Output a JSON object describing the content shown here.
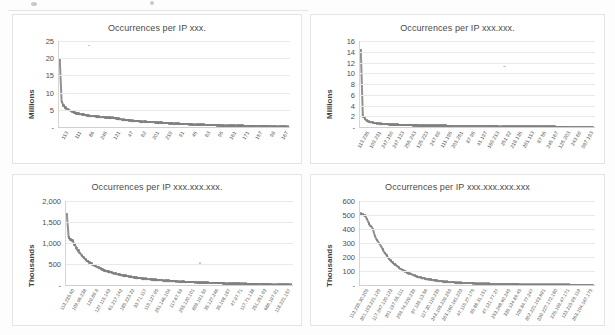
{
  "page": {
    "background_color": "#fdfdfd",
    "series_color": "#7f7f7f",
    "gridline_color": "#e9e9e9"
  },
  "charts": [
    {
      "id": "chart-ip-octet-1",
      "title": "Occurrences per IP xxx.",
      "ylabel": "Millions",
      "yticks": [
        "25",
        "20",
        "15",
        "10",
        "5",
        "-"
      ],
      "ytick_values": [
        25,
        20,
        15,
        10,
        5,
        0
      ],
      "ylim": [
        0,
        25
      ],
      "xlabels": [
        "113",
        "111",
        "86",
        "245",
        "121",
        "47",
        "62",
        "201",
        "219",
        "91",
        "45",
        "63",
        "95",
        "161",
        "171",
        "157",
        "98",
        "167"
      ],
      "values": [
        19.5,
        7.3,
        6.2,
        5.6,
        5.2,
        4.9,
        4.6,
        4.4,
        4.2,
        4.0,
        3.9,
        3.8,
        3.7,
        3.6,
        3.5,
        3.4,
        3.3,
        3.25,
        3.2,
        3.15,
        3.1,
        3.0,
        2.95,
        2.9,
        2.85,
        2.8,
        2.78,
        2.75,
        2.7,
        2.68,
        2.6,
        2.5,
        2.4,
        2.3,
        2.2,
        2.1,
        2.05,
        2.0,
        1.95,
        1.9,
        1.85,
        1.8,
        1.78,
        1.7,
        1.65,
        1.6,
        1.58,
        1.55,
        1.5,
        1.48,
        1.45,
        1.4,
        1.38,
        1.35,
        1.3,
        1.28,
        1.25,
        1.2,
        1.18,
        1.15,
        1.1,
        1.08,
        1.05,
        1.0,
        0.98,
        0.95,
        0.92,
        0.9,
        0.88,
        0.85,
        0.82,
        0.8,
        0.78,
        0.76,
        0.74,
        0.72,
        0.7,
        0.68,
        0.66,
        0.64,
        0.62,
        0.6,
        0.58,
        0.57,
        0.55,
        0.54,
        0.52,
        0.5,
        0.49,
        0.48,
        0.46,
        0.45,
        0.44,
        0.42,
        0.41,
        0.4,
        0.39,
        0.38,
        0.37,
        0.36,
        0.35,
        0.34,
        0.33,
        0.32,
        0.31,
        0.3,
        0.29,
        0.28,
        0.27,
        0.26,
        0.25,
        0.24,
        0.23,
        0.22,
        0.21,
        0.2,
        0.19,
        0.18,
        0.17,
        0.16,
        0.15,
        0.14,
        0.13,
        0.12,
        0.11,
        0.1
      ]
    },
    {
      "id": "chart-ip-octet-2",
      "title": "Occurrences per IP xxx.xxx.",
      "ylabel": "Millions",
      "yticks": [
        "16",
        "14",
        "12",
        "10",
        "8",
        "6",
        "4",
        "2",
        "-"
      ],
      "ytick_values": [
        16,
        14,
        12,
        10,
        8,
        6,
        4,
        2,
        0
      ],
      "ylim": [
        0,
        16
      ],
      "xlabels": [
        "113.235",
        "109.231",
        "247.150",
        "247.123",
        "255.243",
        "125.223",
        "247.69",
        "111.195",
        "201.251",
        "87.95",
        "41.197",
        "169.213",
        "251.92",
        "218.135",
        "281.113",
        "87.55",
        "245.167",
        "125.203",
        "243.69",
        "987.193"
      ],
      "values": [
        14.3,
        2.0,
        1.55,
        1.2,
        1.0,
        0.9,
        0.82,
        0.76,
        0.7,
        0.66,
        0.62,
        0.58,
        0.55,
        0.52,
        0.5,
        0.48,
        0.46,
        0.44,
        0.42,
        0.4,
        0.39,
        0.38,
        0.37,
        0.36,
        0.35,
        0.34,
        0.33,
        0.32,
        0.31,
        0.3,
        0.29,
        0.28,
        0.275,
        0.27,
        0.265,
        0.26,
        0.255,
        0.25,
        0.245,
        0.24,
        0.235,
        0.23,
        0.225,
        0.22,
        0.215,
        0.21,
        0.205,
        0.2,
        0.198,
        0.195,
        0.19,
        0.188,
        0.185,
        0.18,
        0.178,
        0.175,
        0.17,
        0.168,
        0.165,
        0.16,
        0.158,
        0.155,
        0.15,
        0.148,
        0.145,
        0.14,
        0.138,
        0.135,
        0.13,
        0.128,
        0.125,
        0.12,
        0.118,
        0.115,
        0.11,
        0.108,
        0.105,
        0.1,
        0.098,
        0.095,
        0.09,
        0.088,
        0.085,
        0.08,
        0.078,
        0.075,
        0.07,
        0.068,
        0.065,
        0.06,
        0.058,
        0.055,
        0.05,
        0.048,
        0.045,
        0.04,
        0.038,
        0.035,
        0.03,
        0.028,
        0.025,
        0.022,
        0.02,
        0.018,
        0.016,
        0.014,
        0.012,
        0.01,
        0.009,
        0.008,
        0.007,
        0.006,
        0.005,
        0.004,
        0.003,
        0.002
      ]
    },
    {
      "id": "chart-ip-octet-3",
      "title": "Occurrences per IP xxx.xxx.xxx.",
      "ylabel": "Thousands",
      "yticks": [
        "2,000",
        "1,500",
        "1,000",
        "500",
        "-"
      ],
      "ytick_values": [
        2000,
        1500,
        1000,
        500,
        0
      ],
      "ylim": [
        0,
        2000
      ],
      "xlabels": [
        "113.235.60",
        "109.96.238",
        "129.89.9",
        "127.115.143",
        "61.217.142",
        "185.223.22",
        "33.71.117",
        "115.127.95",
        "251.146.104",
        "117.67.59",
        "255.120.101",
        "809.191.50",
        "35.127.246",
        "35.108.187",
        "47.97.71",
        "117.71.138",
        "251.251.93",
        "686.197.91",
        "118.221.157"
      ],
      "values": [
        1690,
        1130,
        1080,
        1060,
        960,
        880,
        820,
        760,
        700,
        650,
        610,
        570,
        540,
        510,
        480,
        455,
        430,
        410,
        390,
        370,
        350,
        335,
        320,
        305,
        292,
        280,
        268,
        258,
        248,
        238,
        229,
        220,
        212,
        204,
        197,
        190,
        183,
        177,
        170,
        165,
        159,
        154,
        149,
        144,
        139,
        135,
        130,
        126,
        122,
        118,
        115,
        111,
        108,
        104,
        101,
        98,
        95,
        92,
        89,
        86,
        84,
        81,
        79,
        76,
        74,
        72,
        70,
        68,
        66,
        64,
        62,
        60,
        58,
        56,
        55,
        53,
        51,
        50,
        48,
        47,
        45,
        44,
        43,
        41,
        40,
        39,
        38,
        37,
        36,
        35,
        34,
        33,
        32,
        31,
        30,
        29,
        28,
        27,
        26,
        25,
        24,
        23,
        22,
        21,
        20,
        19,
        18,
        17,
        16,
        15,
        14,
        13,
        12,
        11,
        10,
        9,
        8,
        7,
        6,
        5
      ]
    },
    {
      "id": "chart-ip-octet-4",
      "title": "Occurrences per IP xxx.xxx.xxx.xxx",
      "ylabel": "Thousands",
      "yticks": [
        "600",
        "500",
        "400",
        "300",
        "200",
        "100",
        "-"
      ],
      "ytick_values": [
        600,
        500,
        400,
        300,
        200,
        100,
        0
      ],
      "ylim": [
        0,
        600
      ],
      "xlabels": [
        "113.235.30.205",
        "301.103.221.125",
        "117.247.120.123",
        "201.197.55.111",
        "259.74.229.239",
        "97.139.13.56",
        "117.30.119.235",
        "243.195.229.255",
        "203.160.181.223",
        "47.115.27.175",
        "95.88.31.151",
        "47.121.77.27",
        "253.248.60.245",
        "335.124.89.45",
        "109.84.77.247",
        "302.221.103.691",
        "239.227.172.180",
        "225.199.47.171",
        "123.215.99.119",
        "263.104.187.175"
      ],
      "values": [
        510,
        505,
        498,
        470,
        440,
        420,
        400,
        350,
        320,
        300,
        280,
        255,
        230,
        210,
        190,
        175,
        160,
        148,
        135,
        125,
        115,
        106,
        98,
        90,
        84,
        78,
        72,
        67,
        62,
        58,
        54,
        50,
        47,
        44,
        41,
        38,
        36,
        34,
        32,
        30,
        28,
        26,
        25,
        23,
        22,
        21,
        20,
        19,
        18,
        17,
        16,
        15,
        14.5,
        14,
        13.5,
        13,
        12.5,
        12,
        11.5,
        11,
        10.5,
        10,
        9.5,
        9,
        8.8,
        8.5,
        8.2,
        8,
        7.8,
        7.5,
        7.2,
        7,
        6.8,
        6.5,
        6.2,
        6,
        5.8,
        5.5,
        5.2,
        5,
        4.8,
        4.6,
        4.4,
        4.2,
        4,
        3.8,
        3.6,
        3.4,
        3.2,
        3,
        2.9,
        2.8,
        2.7,
        2.6,
        2.5,
        2.4,
        2.3,
        2.2,
        2.1,
        2,
        1.9,
        1.8,
        1.7,
        1.6,
        1.5,
        1.4,
        1.3,
        1.2,
        1.1,
        1.0,
        0.9,
        0.8,
        0.7,
        0.6,
        0.5,
        0.4,
        0.3
      ]
    }
  ],
  "chart_data": [
    {
      "type": "scatter",
      "title": "Occurrences per IP xxx.",
      "xlabel": "",
      "ylabel": "Millions",
      "ylim": [
        0,
        25
      ],
      "grid": true,
      "legend": "none",
      "tick_labels_x": [
        "113",
        "111",
        "86",
        "245",
        "121",
        "47",
        "62",
        "201",
        "219",
        "91",
        "45",
        "63",
        "95",
        "161",
        "171",
        "157",
        "98",
        "167"
      ],
      "tick_labels_y": [
        "-",
        "5",
        "10",
        "15",
        "20",
        "25"
      ],
      "series": [
        {
          "name": "Occurrences (millions)",
          "values": [
            19.5,
            7.3,
            6.2,
            5.6,
            5.2,
            4.9,
            4.6,
            4.4,
            4.2,
            4.0,
            3.9,
            3.8,
            3.7,
            3.6,
            3.5,
            3.4,
            3.3,
            3.2,
            3.1,
            3.0,
            2.9,
            2.8,
            2.7,
            2.6,
            2.5,
            2.4,
            2.3,
            2.2,
            2.1,
            2.0,
            1.9,
            1.8,
            1.7,
            1.6,
            1.5,
            1.4,
            1.3,
            1.2,
            1.1,
            1.0,
            0.9,
            0.8,
            0.7,
            0.6,
            0.5,
            0.45,
            0.4,
            0.35,
            0.3,
            0.25,
            0.2,
            0.15,
            0.1
          ]
        }
      ],
      "note": "Steep power-law decay: first point ~19.5M, second ~7.3M, long flat tail near 0"
    },
    {
      "type": "scatter",
      "title": "Occurrences per IP xxx.xxx.",
      "xlabel": "",
      "ylabel": "Millions",
      "ylim": [
        0,
        16
      ],
      "grid": true,
      "legend": "none",
      "tick_labels_x": [
        "113.235",
        "109.231",
        "247.150",
        "247.123",
        "255.243",
        "125.223",
        "247.69",
        "111.195",
        "201.251",
        "87.95",
        "41.197",
        "169.213",
        "251.92",
        "218.135",
        "281.113",
        "87.55",
        "245.167",
        "125.203",
        "243.69",
        "987.193"
      ],
      "tick_labels_y": [
        "-",
        "2",
        "4",
        "6",
        "8",
        "10",
        "12",
        "14",
        "16"
      ],
      "series": [
        {
          "name": "Occurrences (millions)",
          "values": [
            14.3,
            2.0,
            1.55,
            1.2,
            1.0,
            0.8,
            0.65,
            0.55,
            0.45,
            0.4,
            0.35,
            0.3,
            0.25,
            0.2,
            0.15,
            0.12,
            0.1,
            0.08,
            0.06,
            0.04,
            0.02,
            0.01
          ]
        }
      ],
      "note": "First point ~14.3M then immediate drop below 2M; essentially flat tail"
    },
    {
      "type": "scatter",
      "title": "Occurrences per IP xxx.xxx.xxx.",
      "xlabel": "",
      "ylabel": "Thousands",
      "ylim": [
        0,
        2000
      ],
      "grid": true,
      "legend": "none",
      "tick_labels_x": [
        "113.235.60",
        "109.96.238",
        "129.89.9",
        "127.115.143",
        "61.217.142",
        "185.223.22",
        "33.71.117",
        "115.127.95",
        "251.146.104",
        "117.67.59",
        "255.120.101",
        "809.191.50",
        "35.127.246",
        "35.108.187",
        "47.97.71",
        "117.71.138",
        "251.251.93",
        "686.197.91",
        "118.221.157"
      ],
      "tick_labels_y": [
        "-",
        "500",
        "1,000",
        "1,500",
        "2,000"
      ],
      "series": [
        {
          "name": "Occurrences (thousands)",
          "values": [
            1690,
            1130,
            1080,
            1000,
            900,
            800,
            700,
            600,
            500,
            420,
            350,
            290,
            240,
            200,
            160,
            130,
            100,
            80,
            60,
            40,
            25,
            15,
            8,
            4
          ]
        }
      ],
      "note": "Top point ~1,690K, cluster near 1,000-1,150K, then sharp decay to flat tail"
    },
    {
      "type": "scatter",
      "title": "Occurrences per IP xxx.xxx.xxx.xxx",
      "xlabel": "",
      "ylabel": "Thousands",
      "ylim": [
        0,
        600
      ],
      "grid": true,
      "legend": "none",
      "tick_labels_x": [
        "113.235.30.205",
        "301.103.221.125",
        "117.247.120.123",
        "201.197.55.111",
        "259.74.229.239",
        "97.139.13.56",
        "117.30.119.235",
        "243.195.229.255",
        "203.160.181.223",
        "47.115.27.175",
        "95.88.31.151",
        "47.121.77.27",
        "253.248.60.245",
        "335.124.89.45",
        "109.84.77.247",
        "302.221.103.691",
        "239.227.172.180",
        "225.199.47.171",
        "123.215.99.119",
        "263.104.187.175"
      ],
      "tick_labels_y": [
        "-",
        "100",
        "200",
        "300",
        "400",
        "500",
        "600"
      ],
      "series": [
        {
          "name": "Occurrences (thousands)",
          "values": [
            510,
            505,
            490,
            450,
            410,
            370,
            320,
            270,
            220,
            180,
            145,
            115,
            90,
            70,
            55,
            42,
            32,
            24,
            18,
            13,
            9,
            6,
            4,
            2,
            1
          ]
        }
      ],
      "note": "Dense vertical cluster from ~510K down to 0; very long flat tail"
    }
  ]
}
